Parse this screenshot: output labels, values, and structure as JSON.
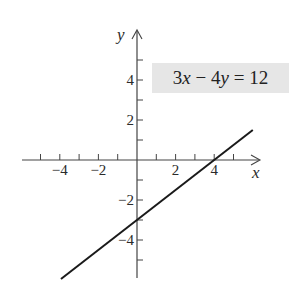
{
  "chart_data": {
    "type": "line",
    "title": "",
    "annotation": "3x − 4y = 12",
    "equation": {
      "text": "3x − 4y = 12",
      "parts": [
        "3",
        "x",
        " − 4",
        "y",
        " = 12"
      ],
      "slope": 0.75,
      "intercept": -3
    },
    "xlabel": "x",
    "ylabel": "y",
    "xlim": [
      -6,
      6.5
    ],
    "ylim": [
      -6,
      6.5
    ],
    "x_ticks": [
      -5,
      -4,
      -3,
      -2,
      -1,
      1,
      2,
      3,
      4,
      5
    ],
    "x_tick_labels": [
      {
        "value": -4,
        "text": "−4"
      },
      {
        "value": -2,
        "text": "−2"
      },
      {
        "value": 2,
        "text": "2"
      },
      {
        "value": 4,
        "text": "4"
      }
    ],
    "y_ticks": [
      -5,
      -4,
      -3,
      -2,
      -1,
      1,
      2,
      3,
      4,
      5
    ],
    "y_tick_labels": [
      {
        "value": 4,
        "text": "4"
      },
      {
        "value": 2,
        "text": "2"
      },
      {
        "value": -2,
        "text": "−2"
      },
      {
        "value": -4,
        "text": "−4"
      }
    ],
    "series": [
      {
        "name": "3x − 4y = 12",
        "x": [
          -3.94,
          6.0
        ],
        "y": [
          -5.95,
          1.5
        ]
      }
    ],
    "grid": false,
    "legend": "none",
    "line_color": "#1a1a1a",
    "axis_color": "#444444",
    "box_color": "#e6e6e6"
  }
}
